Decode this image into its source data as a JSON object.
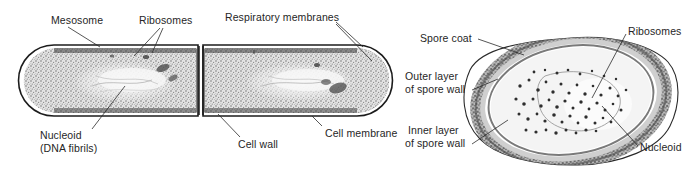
{
  "figure": {
    "title_text": "",
    "background_color": "#ffffff",
    "ink_color": "#1c1c1c",
    "panels": [
      {
        "name": "bacterial-cell-panel",
        "description": "Electron micrograph style drawing of a dividing rod-shaped bacterium (two cells joined by a septum)",
        "labels": [
          {
            "id": "mesosome",
            "text": "Mesosome"
          },
          {
            "id": "ribosomes-left",
            "text": "Ribosomes"
          },
          {
            "id": "respiratory-membranes",
            "text": "Respiratory membranes"
          },
          {
            "id": "nucleoid-line1",
            "text": "Nucleoid"
          },
          {
            "id": "nucleoid-line2",
            "text": "(DNA fibrils)"
          },
          {
            "id": "cell-wall",
            "text": "Cell wall"
          },
          {
            "id": "cell-membrane",
            "text": "Cell membrane"
          }
        ]
      },
      {
        "name": "endospore-panel",
        "description": "Electron micrograph style drawing of a bacterial endospore in cross section",
        "labels": [
          {
            "id": "spore-coat",
            "text": "Spore coat"
          },
          {
            "id": "outer-layer-line1",
            "text": "Outer layer"
          },
          {
            "id": "outer-layer-line2",
            "text": "of spore wall"
          },
          {
            "id": "inner-layer-line1",
            "text": "Inner layer"
          },
          {
            "id": "inner-layer-line2",
            "text": "of spore wall"
          },
          {
            "id": "ribosomes-right",
            "text": "Ribosomes"
          },
          {
            "id": "nucleoid-right",
            "text": "Nucleoid"
          }
        ]
      }
    ]
  }
}
